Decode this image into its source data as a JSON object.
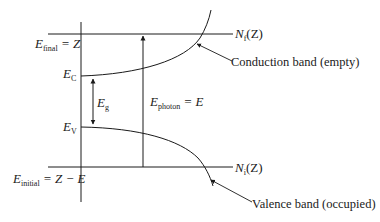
{
  "diagram": {
    "type": "band-energy-diagram",
    "labels": {
      "e_final": {
        "symbol": "E",
        "sub": "final",
        "rhs": " = Z"
      },
      "e_c": {
        "symbol": "E",
        "sub": "C"
      },
      "e_g": {
        "symbol": "E",
        "sub": "g"
      },
      "e_v": {
        "symbol": "E",
        "sub": "V"
      },
      "e_initial": {
        "symbol": "E",
        "sub": "initial",
        "rhs": " = Z − E"
      },
      "e_photon": {
        "symbol": "E",
        "sub": "photon",
        "rhs": " = E"
      },
      "n_f": {
        "symbol": "N",
        "sub": "f",
        "rhs": "(Z)"
      },
      "n_i": {
        "symbol": "N",
        "sub": "i",
        "rhs": "(Z)"
      }
    },
    "annotations": {
      "conduction": "Conduction band (empty)",
      "valence": "Valence band (occupied)"
    },
    "colors": {
      "line": "#1a1a1a",
      "background": "#ffffff"
    }
  }
}
